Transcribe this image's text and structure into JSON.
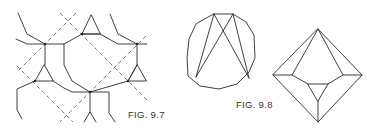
{
  "figures": [
    {
      "id": "fig-9-7",
      "caption": "FIG. 9.7",
      "description": "Network of octagons and triangles with dashed diagonal guide lines"
    },
    {
      "id": "fig-9-8",
      "caption": "FIG. 9.8",
      "description": "Dodecagon with inscribed crossing chords, and an octahedral-like polyhedron projection"
    }
  ],
  "colors": {
    "line": "#2a2a2a",
    "background": "#ffffff"
  }
}
